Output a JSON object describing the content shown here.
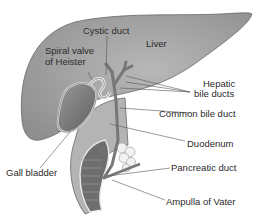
{
  "diagram": {
    "labels": {
      "cystic_duct": "Cystic duct",
      "liver": "Liver",
      "spiral_valve_line1": "Spiral valve",
      "spiral_valve_line2": "of Heister",
      "hepatic_line1": "Hepatic",
      "hepatic_line2": "bile ducts",
      "common_bile_duct": "Common bile duct",
      "duodenum": "Duodenum",
      "gall_bladder": "Gall bladder",
      "pancreatic_duct": "Pancreatic duct",
      "ampulla": "Ampulla of Vater"
    },
    "colors": {
      "liver": "#a9a9a9",
      "gall_bladder": "#7d7d7d",
      "duodenum": "#b4b4b4",
      "ducts": "#8a8a8a",
      "leader_lines": "#555555"
    }
  }
}
